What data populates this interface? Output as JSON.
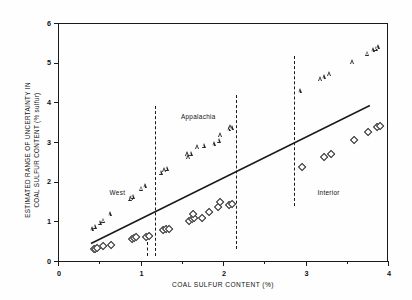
{
  "chart_data": {
    "type": "scatter",
    "title": "",
    "xlabel": "COAL SULFUR CONTENT (%)",
    "ylabel": "ESTIMATED RANGE OF UNCERTAINTY IN COAL SULFUR CONTENT (% sulfur)",
    "ylabel_line1": "ESTIMATED RANGE OF UNCERTAINTY IN",
    "ylabel_line2": "COAL SULFUR CONTENT (% sulfur)",
    "xlim": [
      0,
      4
    ],
    "ylim": [
      0,
      6
    ],
    "xticks": [
      0,
      1,
      2,
      3,
      4
    ],
    "xticks_minor": [
      0.5,
      1.5,
      2.5,
      3.5
    ],
    "yticks": [
      0,
      1,
      2,
      3,
      4,
      5,
      6
    ],
    "grid": false,
    "legend": "none",
    "axis_color": "#1a1a1a",
    "marker_color": "#262626",
    "background": "#fefefe",
    "annotations": [
      {
        "text": "West",
        "x": 0.72,
        "y": 1.72
      },
      {
        "text": "Appalachia",
        "x": 1.7,
        "y": 3.62
      },
      {
        "text": "Interior",
        "x": 3.28,
        "y": 1.72
      }
    ],
    "region_dividers": {
      "style": "dashed",
      "items": [
        {
          "x": 1.18,
          "y0": 0.12,
          "y1": 3.9
        },
        {
          "x": 2.16,
          "y0": 0.3,
          "y1": 4.18
        },
        {
          "x": 2.86,
          "y0": 1.38,
          "y1": 5.18
        }
      ],
      "short_tick": {
        "x": 1.08,
        "y0": 0.12,
        "y1": 0.48
      }
    },
    "trend_line": {
      "label": "reference trend",
      "style": "solid",
      "x0": 0.4,
      "y0": 0.44,
      "x1": 3.78,
      "y1": 3.92
    },
    "series": [
      {
        "name": "upper bound",
        "marker": "triangle",
        "points": [
          [
            0.42,
            0.82
          ],
          [
            0.46,
            0.88
          ],
          [
            0.52,
            0.98
          ],
          [
            0.56,
            1.03
          ],
          [
            0.64,
            1.19
          ],
          [
            0.88,
            1.58
          ],
          [
            0.9,
            1.6
          ],
          [
            0.92,
            1.63
          ],
          [
            1.02,
            1.84
          ],
          [
            1.06,
            1.9
          ],
          [
            1.26,
            2.24
          ],
          [
            1.3,
            2.3
          ],
          [
            1.33,
            2.34
          ],
          [
            1.57,
            2.68
          ],
          [
            1.58,
            2.7
          ],
          [
            1.59,
            2.63
          ],
          [
            1.62,
            2.72
          ],
          [
            1.7,
            2.88
          ],
          [
            1.78,
            2.92
          ],
          [
            1.9,
            2.96
          ],
          [
            1.96,
            3.04
          ],
          [
            1.98,
            3.18
          ],
          [
            2.08,
            3.34
          ],
          [
            2.1,
            3.38
          ],
          [
            2.12,
            3.36
          ],
          [
            2.94,
            4.29
          ],
          [
            3.19,
            4.6
          ],
          [
            3.23,
            4.64
          ],
          [
            3.3,
            4.72
          ],
          [
            3.58,
            5.02
          ],
          [
            3.76,
            5.24
          ],
          [
            3.83,
            5.33
          ],
          [
            3.86,
            5.36
          ],
          [
            3.89,
            5.4
          ]
        ]
      },
      {
        "name": "lower bound",
        "marker": "diamond",
        "points": [
          [
            0.42,
            0.32
          ],
          [
            0.44,
            0.33
          ],
          [
            0.46,
            0.34
          ],
          [
            0.53,
            0.4
          ],
          [
            0.63,
            0.42
          ],
          [
            0.88,
            0.58
          ],
          [
            0.91,
            0.6
          ],
          [
            0.94,
            0.62
          ],
          [
            1.05,
            0.64
          ],
          [
            1.09,
            0.65
          ],
          [
            1.26,
            0.8
          ],
          [
            1.3,
            0.82
          ],
          [
            1.34,
            0.83
          ],
          [
            1.58,
            1.04
          ],
          [
            1.61,
            1.08
          ],
          [
            1.64,
            1.11
          ],
          [
            1.63,
            1.2
          ],
          [
            1.73,
            1.1
          ],
          [
            1.82,
            1.27
          ],
          [
            1.93,
            1.38
          ],
          [
            1.95,
            1.51
          ],
          [
            2.06,
            1.43
          ],
          [
            2.1,
            1.45
          ],
          [
            2.95,
            2.4
          ],
          [
            3.21,
            2.65
          ],
          [
            3.3,
            2.73
          ],
          [
            3.58,
            3.08
          ],
          [
            3.75,
            3.28
          ],
          [
            3.85,
            3.41
          ],
          [
            3.89,
            3.42
          ]
        ]
      }
    ]
  }
}
